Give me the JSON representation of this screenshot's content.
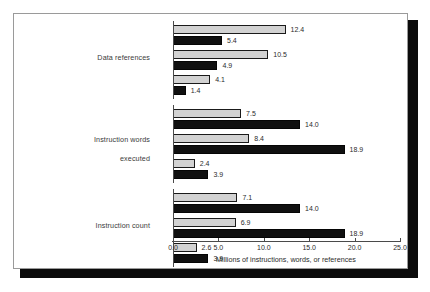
{
  "chart_data": {
    "type": "bar",
    "orientation": "horizontal",
    "title": "",
    "xlabel": "Millions of instructions, words, or references",
    "ylabel": "",
    "xlim": [
      0.0,
      25.0
    ],
    "xticks": [
      "0.0",
      "5.0",
      "10.0",
      "15.0",
      "20.0",
      "25.0"
    ],
    "xtick_values": [
      0,
      5,
      10,
      15,
      20,
      25
    ],
    "grid": false,
    "legend": null,
    "legend_position": "none",
    "series": [
      {
        "name": "m-m",
        "style": "light-gray-fill-black-outline"
      },
      {
        "name": "l/s",
        "style": "solid-black-fill"
      }
    ],
    "groups": [
      {
        "label_line1": "Data references",
        "label_line2": "",
        "bars": [
          {
            "label": "TeX, m-m",
            "value": 12.4,
            "display": "12.4",
            "style": "light"
          },
          {
            "label": "TeX, l/s",
            "value": 5.4,
            "display": "5.4",
            "style": "dark"
          },
          {
            "label": "Spice, m-m",
            "value": 10.5,
            "display": "10.5",
            "style": "light"
          },
          {
            "label": "Spice, l/s",
            "value": 4.9,
            "display": "4.9",
            "style": "dark"
          },
          {
            "label": "GCC, m-m",
            "value": 4.1,
            "display": "4.1",
            "style": "light"
          },
          {
            "label": "GCC, l/s",
            "value": 1.4,
            "display": "1.4",
            "style": "dark"
          }
        ]
      },
      {
        "label_line1": "Instruction words",
        "label_line2": "executed",
        "bars": [
          {
            "label": "TeX, m-m",
            "value": 7.5,
            "display": "7.5",
            "style": "light"
          },
          {
            "label": "TeX, l/s",
            "value": 14.0,
            "display": "14.0",
            "style": "dark"
          },
          {
            "label": "Spice, m-m",
            "value": 8.4,
            "display": "8.4",
            "style": "light"
          },
          {
            "label": "Spice, l/s",
            "value": 18.9,
            "display": "18.9",
            "style": "dark"
          },
          {
            "label": "GCC, m-m",
            "value": 2.4,
            "display": "2.4",
            "style": "light"
          },
          {
            "label": "GCC, l/s",
            "value": 3.9,
            "display": "3.9",
            "style": "dark"
          }
        ]
      },
      {
        "label_line1": "Instruction count",
        "label_line2": "",
        "bars": [
          {
            "label": "TeX, m-m",
            "value": 7.1,
            "display": "7.1",
            "style": "light"
          },
          {
            "label": "TeX, l/s",
            "value": 14.0,
            "display": "14.0",
            "style": "dark"
          },
          {
            "label": "Spice, m-m",
            "value": 6.9,
            "display": "6.9",
            "style": "light"
          },
          {
            "label": "Spice, l/s",
            "value": 18.9,
            "display": "18.9",
            "style": "dark"
          },
          {
            "label": "GCC, m-m",
            "value": 2.6,
            "display": "2.6",
            "style": "light"
          },
          {
            "label": "GCC, l/s",
            "value": 3.9,
            "display": "3.9",
            "style": "dark"
          }
        ]
      }
    ]
  },
  "colors": {
    "light_bar_fill": "#d2d2d2",
    "light_bar_outline": "#1a1a1a",
    "dark_bar_fill": "#101010",
    "axis": "#4a4a4a",
    "text": "#2b2b2b",
    "frame_border": "#9a9a9a",
    "shadow": "#0b0b0b",
    "background": "#ffffff"
  }
}
